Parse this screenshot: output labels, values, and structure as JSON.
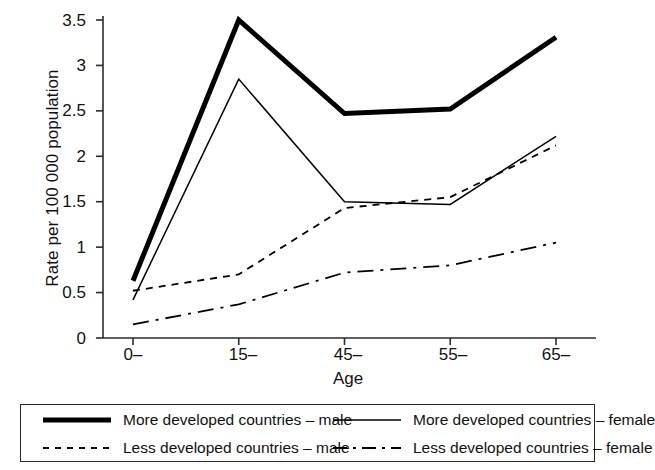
{
  "chart_data": {
    "type": "line",
    "title": "",
    "xlabel": "Age",
    "ylabel": "Rate per 100 000 population",
    "categories": [
      "0–",
      "15–",
      "45–",
      "55–",
      "65–"
    ],
    "ylim": [
      0,
      3.5
    ],
    "yticks": [
      0,
      0.5,
      1,
      1.5,
      2,
      2.5,
      3,
      3.5
    ],
    "ytick_labels": [
      "0",
      "0.5",
      "1",
      "1.5",
      "2",
      "2.5",
      "3",
      "3.5"
    ],
    "grid": false,
    "legend_position": "bottom",
    "series": [
      {
        "name": "More developed countries – male",
        "style": "solid-thick",
        "color": "#000000",
        "values": [
          0.63,
          3.5,
          2.47,
          2.52,
          3.31
        ]
      },
      {
        "name": "More developed countries – female",
        "style": "solid-thin",
        "color": "#000000",
        "values": [
          0.42,
          2.85,
          1.5,
          1.47,
          2.22
        ]
      },
      {
        "name": "Less developed countries – male",
        "style": "dashed",
        "color": "#000000",
        "values": [
          0.52,
          0.7,
          1.43,
          1.55,
          2.12
        ]
      },
      {
        "name": "Less developed countries – female",
        "style": "dash-dot",
        "color": "#000000",
        "values": [
          0.15,
          0.37,
          0.72,
          0.8,
          1.05
        ]
      }
    ]
  },
  "axes": {
    "y_title": "Rate per 100 000 population",
    "x_title": "Age",
    "y_tick_labels": [
      "3.5",
      "3",
      "2.5",
      "2",
      "1.5",
      "1",
      "0.5",
      "0"
    ],
    "x_tick_labels": [
      "0–",
      "15–",
      "45–",
      "55–",
      "65–"
    ]
  },
  "legend": {
    "rows": [
      {
        "left": {
          "label": "More developed countries – male",
          "style": "solid-thick"
        },
        "right": {
          "label": "More developed countries – female",
          "style": "solid-thin"
        }
      },
      {
        "left": {
          "label": "Less developed countries – male",
          "style": "dashed"
        },
        "right": {
          "label": "Less developed countries – female",
          "style": "dash-dot"
        }
      }
    ]
  }
}
